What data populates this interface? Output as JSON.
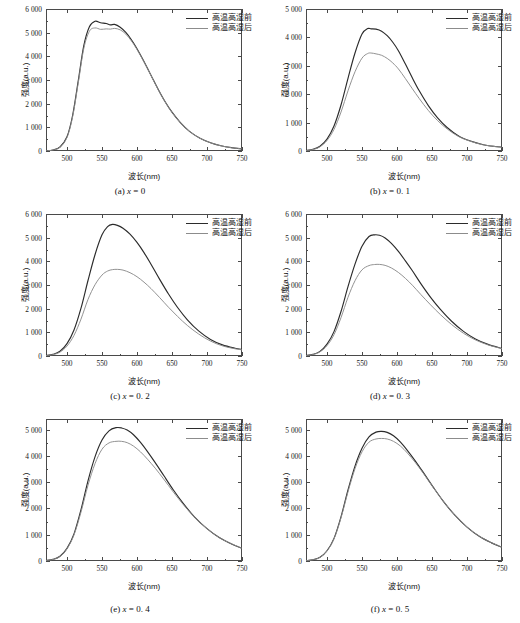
{
  "figure": {
    "axis_titles": {
      "x": "波长(nm)",
      "y": "强度(a.u.)"
    },
    "legend": [
      {
        "label": "高温高湿前",
        "color": "#2b2b2b"
      },
      {
        "label": "高温高湿后",
        "color": "#8c8c8c"
      }
    ],
    "colors": {
      "before": "#2b2b2b",
      "after": "#8c8c8c",
      "axis": "#4a4a4a"
    }
  },
  "chart_data": [
    {
      "type": "line",
      "panel": "a",
      "caption_prefix": "(a)",
      "caption_var": "x",
      "caption_eq": "=",
      "caption_value": "0",
      "xlabel": "波长(nm)",
      "ylabel": "强度(a.u.)",
      "xlim": [
        470,
        750
      ],
      "ylim": [
        0,
        6000
      ],
      "xticks": [
        500,
        550,
        600,
        650,
        700,
        750
      ],
      "yticks": [
        0,
        1000,
        2000,
        3000,
        4000,
        5000,
        6000
      ],
      "yticklabels": [
        "0",
        "1 000",
        "2 000",
        "3 000",
        "4 000",
        "5 000",
        "6 000"
      ],
      "grid": false,
      "legend_position": "upper-right",
      "x": [
        470,
        480,
        490,
        500,
        508,
        516,
        524,
        532,
        540,
        548,
        556,
        562,
        568,
        576,
        584,
        592,
        600,
        610,
        620,
        630,
        640,
        650,
        662,
        675,
        690,
        705,
        720,
        735,
        750
      ],
      "series": [
        {
          "name": "高温高湿前",
          "color": "#2b2b2b",
          "values": [
            10,
            45,
            170,
            600,
            1500,
            2950,
            4450,
            5250,
            5480,
            5420,
            5390,
            5330,
            5350,
            5230,
            5010,
            4700,
            4320,
            3780,
            3200,
            2620,
            2090,
            1640,
            1200,
            830,
            540,
            350,
            220,
            140,
            90
          ],
          "peak": {
            "x": 541,
            "y": 5480
          }
        },
        {
          "name": "高温高湿后",
          "color": "#8c8c8c",
          "values": [
            10,
            42,
            160,
            575,
            1440,
            2860,
            4330,
            5060,
            5200,
            5140,
            5160,
            5150,
            5180,
            5120,
            4940,
            4650,
            4290,
            3760,
            3190,
            2610,
            2080,
            1630,
            1195,
            828,
            538,
            349,
            219,
            139,
            89
          ],
          "peak": {
            "x": 543,
            "y": 5210
          }
        }
      ]
    },
    {
      "type": "line",
      "panel": "b",
      "caption_prefix": "(b)",
      "caption_var": "x",
      "caption_eq": "=",
      "caption_value": "0. 1",
      "xlabel": "波长(nm)",
      "ylabel": "强度(a.u.)",
      "xlim": [
        470,
        750
      ],
      "ylim": [
        0,
        5000
      ],
      "xticks": [
        500,
        550,
        600,
        650,
        700,
        750
      ],
      "yticks": [
        0,
        1000,
        2000,
        3000,
        4000,
        5000
      ],
      "yticklabels": [
        "0",
        "1 000",
        "2 000",
        "3 000",
        "4 000",
        "5 000"
      ],
      "grid": false,
      "legend_position": "upper-right",
      "x": [
        470,
        480,
        490,
        500,
        510,
        520,
        530,
        540,
        550,
        558,
        563,
        570,
        578,
        586,
        594,
        602,
        612,
        622,
        632,
        645,
        658,
        672,
        688,
        705,
        722,
        740,
        750
      ],
      "series": [
        {
          "name": "高温高湿前",
          "color": "#2b2b2b",
          "values": [
            20,
            60,
            170,
            420,
            880,
            1620,
            2560,
            3450,
            4120,
            4310,
            4300,
            4290,
            4220,
            4060,
            3830,
            3530,
            3060,
            2570,
            2110,
            1590,
            1170,
            820,
            530,
            350,
            230,
            160,
            140
          ],
          "peak": {
            "x": 561,
            "y": 4330
          }
        },
        {
          "name": "高温高湿后",
          "color": "#8c8c8c",
          "values": [
            18,
            52,
            150,
            370,
            760,
            1370,
            2120,
            2790,
            3270,
            3430,
            3450,
            3420,
            3370,
            3260,
            3100,
            2890,
            2550,
            2190,
            1840,
            1420,
            1070,
            770,
            510,
            340,
            225,
            155,
            135
          ],
          "peak": {
            "x": 565,
            "y": 3455
          }
        }
      ]
    },
    {
      "type": "line",
      "panel": "c",
      "caption_prefix": "(c)",
      "caption_var": "x",
      "caption_eq": "=",
      "caption_value": "0. 2",
      "xlabel": "波长(nm)",
      "ylabel": "强度(a.u.)",
      "xlim": [
        470,
        750
      ],
      "ylim": [
        0,
        6000
      ],
      "xticks": [
        500,
        550,
        600,
        650,
        700,
        750
      ],
      "yticks": [
        0,
        1000,
        2000,
        3000,
        4000,
        5000,
        6000
      ],
      "yticklabels": [
        "0",
        "1 000",
        "2 000",
        "3 000",
        "4 000",
        "5 000",
        "6 000"
      ],
      "grid": false,
      "legend_position": "upper-right",
      "x": [
        470,
        480,
        490,
        500,
        510,
        520,
        530,
        540,
        550,
        558,
        565,
        572,
        580,
        590,
        600,
        610,
        620,
        632,
        645,
        658,
        672,
        688,
        705,
        722,
        740,
        750
      ],
      "series": [
        {
          "name": "高温高湿前",
          "color": "#2b2b2b",
          "values": [
            25,
            70,
            200,
            520,
            1100,
            2020,
            3190,
            4280,
            5120,
            5470,
            5560,
            5520,
            5400,
            5150,
            4800,
            4370,
            3880,
            3260,
            2620,
            2050,
            1530,
            1060,
            700,
            470,
            330,
            280
          ],
          "peak": {
            "x": 564,
            "y": 5570
          }
        },
        {
          "name": "高温高湿后",
          "color": "#8c8c8c",
          "values": [
            20,
            58,
            165,
            420,
            870,
            1560,
            2390,
            3010,
            3420,
            3590,
            3650,
            3660,
            3630,
            3520,
            3350,
            3120,
            2850,
            2480,
            2060,
            1670,
            1290,
            930,
            630,
            430,
            305,
            260
          ],
          "peak": {
            "x": 570,
            "y": 3660
          }
        }
      ]
    },
    {
      "type": "line",
      "panel": "d",
      "caption_prefix": "(d)",
      "caption_var": "x",
      "caption_eq": "=",
      "caption_value": "0. 3",
      "xlabel": "波长(nm)",
      "ylabel": "强度(a.u.)",
      "xlim": [
        470,
        750
      ],
      "ylim": [
        0,
        6000
      ],
      "xticks": [
        500,
        550,
        600,
        650,
        700,
        750
      ],
      "yticks": [
        0,
        1000,
        2000,
        3000,
        4000,
        5000,
        6000
      ],
      "yticklabels": [
        "0",
        "1 000",
        "2 000",
        "3 000",
        "4 000",
        "5 000",
        "6 000"
      ],
      "grid": false,
      "legend_position": "upper-right",
      "x": [
        470,
        480,
        490,
        500,
        510,
        520,
        530,
        540,
        550,
        560,
        568,
        575,
        583,
        592,
        602,
        612,
        622,
        634,
        648,
        662,
        678,
        695,
        712,
        730,
        750
      ],
      "series": [
        {
          "name": "高温高湿前",
          "color": "#2b2b2b",
          "values": [
            25,
            70,
            195,
            500,
            1030,
            1880,
            2930,
            3880,
            4640,
            5050,
            5120,
            5100,
            4990,
            4760,
            4420,
            4020,
            3600,
            3060,
            2480,
            1970,
            1470,
            1040,
            720,
            490,
            320
          ],
          "peak": {
            "x": 569,
            "y": 5125
          }
        },
        {
          "name": "高温高湿后",
          "color": "#8c8c8c",
          "values": [
            22,
            62,
            175,
            440,
            900,
            1620,
            2480,
            3180,
            3640,
            3820,
            3865,
            3870,
            3830,
            3720,
            3530,
            3280,
            2990,
            2600,
            2160,
            1750,
            1330,
            960,
            680,
            470,
            310
          ],
          "peak": {
            "x": 576,
            "y": 3870
          }
        }
      ]
    },
    {
      "type": "line",
      "panel": "e",
      "caption_prefix": "(e)",
      "caption_var": "x",
      "caption_eq": "=",
      "caption_value": "0. 4",
      "xlabel": "波长(nm)",
      "ylabel": "强度(a.u.)",
      "xlim": [
        470,
        750
      ],
      "ylim": [
        0,
        5400
      ],
      "xticks": [
        500,
        550,
        600,
        650,
        700,
        750
      ],
      "yticks": [
        0,
        1000,
        2000,
        3000,
        4000,
        5000
      ],
      "yticklabels": [
        "0",
        "1 000",
        "2 000",
        "3 000",
        "4 000",
        "5 000"
      ],
      "grid": false,
      "legend_position": "upper-right",
      "x": [
        470,
        480,
        490,
        500,
        510,
        520,
        530,
        540,
        550,
        560,
        570,
        578,
        586,
        595,
        605,
        615,
        626,
        638,
        652,
        666,
        682,
        700,
        718,
        735,
        750
      ],
      "series": [
        {
          "name": "高温高湿前",
          "color": "#2b2b2b",
          "values": [
            20,
            60,
            180,
            480,
            1030,
            1950,
            3050,
            3960,
            4600,
            4950,
            5070,
            5060,
            4980,
            4800,
            4510,
            4160,
            3740,
            3260,
            2700,
            2190,
            1680,
            1230,
            880,
            650,
            480
          ],
          "peak": {
            "x": 573,
            "y": 5080
          }
        },
        {
          "name": "高温高湿后",
          "color": "#8c8c8c",
          "values": [
            20,
            58,
            175,
            465,
            990,
            1860,
            2880,
            3700,
            4250,
            4490,
            4550,
            4550,
            4500,
            4370,
            4150,
            3870,
            3530,
            3120,
            2620,
            2150,
            1670,
            1230,
            885,
            655,
            485
          ],
          "peak": {
            "x": 576,
            "y": 4560
          }
        }
      ]
    },
    {
      "type": "line",
      "panel": "f",
      "caption_prefix": "(f)",
      "caption_var": "x",
      "caption_eq": "=",
      "caption_value": "0. 5",
      "xlabel": "波长(nm)",
      "ylabel": "强度(a.u.)",
      "xlim": [
        470,
        750
      ],
      "ylim": [
        0,
        5400
      ],
      "xticks": [
        500,
        550,
        600,
        650,
        700,
        750
      ],
      "yticks": [
        0,
        1000,
        2000,
        3000,
        4000,
        5000
      ],
      "yticklabels": [
        "0",
        "1 000",
        "2 000",
        "3 000",
        "4 000",
        "5 000"
      ],
      "grid": false,
      "legend_position": "upper-right",
      "x": [
        470,
        480,
        490,
        500,
        510,
        520,
        530,
        540,
        550,
        560,
        570,
        578,
        586,
        595,
        605,
        615,
        626,
        638,
        652,
        666,
        682,
        700,
        718,
        735,
        750
      ],
      "series": [
        {
          "name": "高温高湿前",
          "color": "#2b2b2b",
          "values": [
            15,
            45,
            140,
            390,
            860,
            1680,
            2700,
            3610,
            4290,
            4720,
            4900,
            4930,
            4890,
            4760,
            4520,
            4200,
            3810,
            3350,
            2800,
            2280,
            1760,
            1290,
            930,
            690,
            520
          ],
          "peak": {
            "x": 578,
            "y": 4930
          }
        },
        {
          "name": "高温高湿后",
          "color": "#8c8c8c",
          "values": [
            15,
            44,
            138,
            382,
            840,
            1640,
            2630,
            3510,
            4150,
            4520,
            4640,
            4660,
            4640,
            4550,
            4370,
            4100,
            3750,
            3320,
            2790,
            2280,
            1765,
            1295,
            935,
            695,
            525
          ],
          "peak": {
            "x": 580,
            "y": 4660
          }
        }
      ]
    }
  ]
}
